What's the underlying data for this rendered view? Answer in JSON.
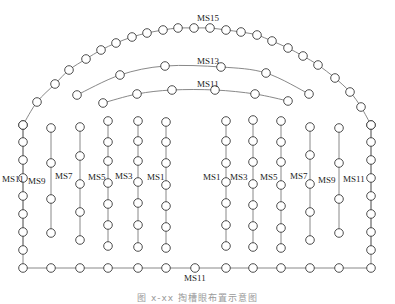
{
  "diagram": {
    "type": "blast hole layout (tunnel face)",
    "colors": {
      "line": "#7a7a7a",
      "hole": "#3a3a3a",
      "text": "#222222"
    },
    "hole_radius": 4.3,
    "outline": {
      "label": "MS15",
      "label_pos": [
        197,
        21
      ],
      "arc_holes": [
        [
          23,
          125
        ],
        [
          37,
          102
        ],
        [
          55,
          84
        ],
        [
          69,
          70
        ],
        [
          86,
          59
        ],
        [
          101,
          50
        ],
        [
          116,
          43
        ],
        [
          132,
          37
        ],
        [
          147,
          33
        ],
        [
          163,
          30
        ],
        [
          178,
          28
        ],
        [
          194,
          28
        ],
        [
          210,
          28
        ],
        [
          226,
          30
        ],
        [
          241,
          32
        ],
        [
          257,
          35
        ],
        [
          272,
          41
        ],
        [
          288,
          48
        ],
        [
          303,
          56
        ],
        [
          318,
          65
        ],
        [
          335,
          78
        ],
        [
          350,
          92
        ],
        [
          361,
          107
        ],
        [
          371,
          125
        ]
      ]
    },
    "arcs": [
      {
        "label": "MS13",
        "label_pos": [
          197,
          64
        ],
        "holes": [
          [
            77,
            95
          ],
          [
            120,
            75
          ],
          [
            165,
            66
          ],
          [
            221,
            67
          ],
          [
            266,
            73
          ],
          [
            309,
            94
          ]
        ]
      },
      {
        "label": "MS11",
        "label_pos": [
          197,
          87
        ],
        "holes": [
          [
            103,
            103
          ],
          [
            137,
            94
          ],
          [
            172,
            90
          ],
          [
            215,
            90
          ],
          [
            255,
            94
          ],
          [
            288,
            101
          ]
        ]
      }
    ],
    "columns": [
      {
        "label": "MS11",
        "x": 23,
        "label_pos": [
          2,
          182
        ],
        "top": 125,
        "holes": [
          125,
          142,
          160,
          178,
          196,
          214,
          232,
          250
        ]
      },
      {
        "label": "MS9",
        "x": 51,
        "label_pos": [
          28,
          184
        ],
        "top": 128,
        "holes": [
          128,
          163,
          199,
          233
        ]
      },
      {
        "label": "MS7",
        "x": 80,
        "label_pos": [
          55,
          179
        ],
        "top": 127,
        "holes": [
          127,
          156,
          184,
          212,
          240
        ]
      },
      {
        "label": "MS5",
        "x": 108,
        "label_pos": [
          88,
          180
        ],
        "top": 121,
        "holes": [
          121,
          142,
          161,
          183,
          204,
          225,
          246
        ]
      },
      {
        "label": "MS3",
        "x": 138,
        "label_pos": [
          115,
          179
        ],
        "top": 121,
        "holes": [
          121,
          141,
          161,
          182,
          203,
          225,
          247
        ]
      },
      {
        "label": "MS1",
        "x": 166,
        "label_pos": [
          147,
          180
        ],
        "top": 122,
        "holes": [
          122,
          142,
          163,
          185,
          206,
          227,
          248
        ]
      },
      {
        "label": "MS1",
        "x": 226,
        "label_pos": [
          203,
          180
        ],
        "top": 121,
        "holes": [
          121,
          141,
          163,
          182,
          203,
          225,
          246
        ]
      },
      {
        "label": "MS3",
        "x": 253,
        "label_pos": [
          230,
          180
        ],
        "top": 120,
        "holes": [
          120,
          141,
          162,
          184,
          205,
          226,
          247
        ]
      },
      {
        "label": "MS5",
        "x": 281,
        "label_pos": [
          260,
          180
        ],
        "top": 121,
        "holes": [
          121,
          142,
          162,
          185,
          206,
          228,
          248
        ]
      },
      {
        "label": "MS7",
        "x": 310,
        "label_pos": [
          290,
          179
        ],
        "top": 127,
        "holes": [
          127,
          155,
          184,
          212,
          240
        ]
      },
      {
        "label": "MS9",
        "x": 339,
        "label_pos": [
          318,
          183
        ],
        "top": 128,
        "holes": [
          128,
          163,
          199,
          233
        ]
      },
      {
        "label": "MS11",
        "x": 371,
        "label_pos": [
          343,
          182
        ],
        "top": 125,
        "holes": [
          125,
          142,
          160,
          178,
          196,
          214,
          232,
          250
        ]
      }
    ],
    "floor": {
      "label": "MS11",
      "label_pos": [
        184,
        281
      ],
      "y": 268,
      "holes_x": [
        23,
        51,
        80,
        108,
        138,
        166,
        195,
        226,
        253,
        281,
        310,
        339,
        371
      ]
    },
    "caption": "图 x-xx  掏槽眼布置示意图"
  }
}
